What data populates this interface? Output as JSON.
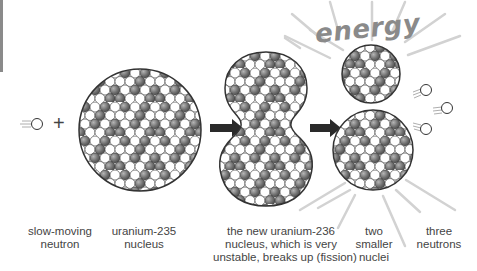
{
  "diagram": {
    "title_word": "energy",
    "operator": "+",
    "colors": {
      "background": "#ffffff",
      "outline": "#333333",
      "proton": "#7a7a7a",
      "neutron_particle": "#ffffff",
      "arrow": "#2a2a2a",
      "rays": "#d2d2d2",
      "energy_text": "#8a8a8a",
      "label_text": "#444444"
    },
    "stages": [
      {
        "id": "slow-neutron",
        "label_line1": "slow-moving",
        "label_line2": "neutron"
      },
      {
        "id": "uranium-235",
        "label_line1": "uranium-235",
        "label_line2": "nucleus"
      },
      {
        "id": "uranium-236",
        "label_line1": "the new uranium-236",
        "label_line2": "nucleus, which is very",
        "label_line3": "unstable, breaks up (fission)"
      },
      {
        "id": "smaller-nuclei",
        "label_line1": "two",
        "label_line2": "smaller",
        "label_line3": "nuclei"
      },
      {
        "id": "three-neutrons",
        "label_line1": "three",
        "label_line2": "neutrons"
      }
    ]
  }
}
